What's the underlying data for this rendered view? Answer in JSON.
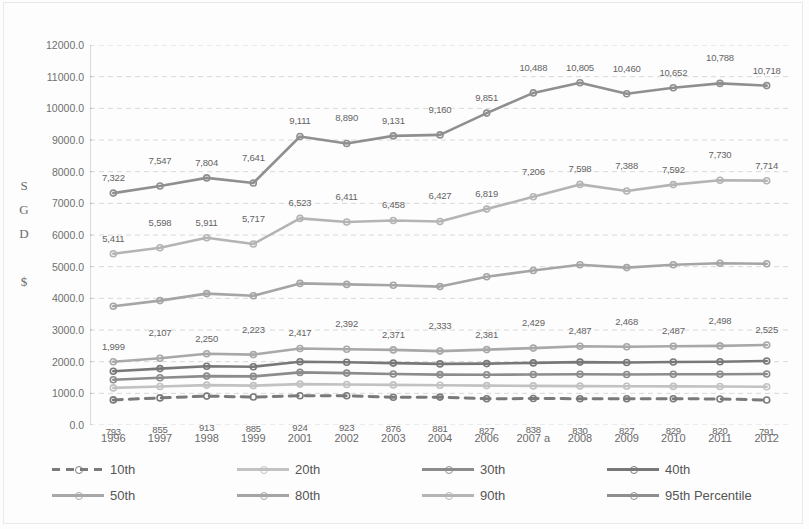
{
  "chart_data": {
    "type": "line",
    "title": "",
    "xlabel": "",
    "ylabel": "SGD $",
    "ylim": [
      0,
      12000
    ],
    "ytick_step": 1000,
    "grid": true,
    "legend_position": "bottom",
    "categories": [
      "1996",
      "1997",
      "1998",
      "1999",
      "2001",
      "2002",
      "2003",
      "2004",
      "2006",
      "2007 a",
      "2008",
      "2009",
      "2010",
      "2011",
      "2012"
    ],
    "ytick_labels": [
      "12000.0",
      "11000.0",
      "10000.0",
      "9000.0",
      "8000.0",
      "7000.0",
      "6000.0",
      "5000.0",
      "4000.0",
      "3000.0",
      "2000.0",
      "1000.0",
      "0.0"
    ],
    "series": [
      {
        "name": "10th",
        "color": "#7a7a7a",
        "style": "dashed",
        "labeled": true,
        "values": [
          793,
          855,
          913,
          885,
          924,
          923,
          876,
          881,
          827,
          838,
          830,
          827,
          829,
          820,
          791
        ],
        "labels": [
          "793",
          "855",
          "913",
          "885",
          "924",
          "923",
          "876",
          "881",
          "827",
          "838",
          "830",
          "827",
          "829",
          "820",
          "791"
        ],
        "label_position": "below"
      },
      {
        "name": "20th",
        "color": "#c2c2c2",
        "style": "solid",
        "labeled": false,
        "values": [
          1170,
          1215,
          1260,
          1245,
          1290,
          1280,
          1265,
          1255,
          1245,
          1235,
          1230,
          1225,
          1220,
          1215,
          1210
        ],
        "labels": [],
        "label_position": "none"
      },
      {
        "name": "30th",
        "color": "#8c8c8c",
        "style": "solid",
        "labeled": false,
        "values": [
          1430,
          1490,
          1545,
          1535,
          1660,
          1640,
          1610,
          1590,
          1585,
          1595,
          1600,
          1595,
          1600,
          1605,
          1610
        ],
        "labels": [],
        "label_position": "none"
      },
      {
        "name": "40th",
        "color": "#787878",
        "style": "solid",
        "labeled": false,
        "values": [
          1700,
          1780,
          1855,
          1840,
          1995,
          1980,
          1955,
          1930,
          1940,
          1960,
          1985,
          1975,
          1990,
          2000,
          2020
        ],
        "labels": [],
        "label_position": "none"
      },
      {
        "name": "50th",
        "color": "#a8a8a8",
        "style": "solid",
        "labeled": true,
        "values": [
          1999,
          2107,
          2250,
          2223,
          2417,
          2392,
          2371,
          2333,
          2381,
          2429,
          2487,
          2468,
          2487,
          2498,
          2525
        ],
        "labels": [
          "1,999",
          "2,107",
          "2,250",
          "2,223",
          "2,417",
          "2,392",
          "2,371",
          "2,333",
          "2,381",
          "2,429",
          "2,487",
          "2,468",
          "2,487",
          "2,498",
          "2,525"
        ],
        "label_position": "above"
      },
      {
        "name": "80th",
        "color": "#a5a5a5",
        "style": "solid",
        "labeled": false,
        "values": [
          3750,
          3930,
          4150,
          4080,
          4470,
          4440,
          4410,
          4370,
          4680,
          4880,
          5060,
          4970,
          5060,
          5105,
          5090
        ],
        "labels": [],
        "label_position": "none"
      },
      {
        "name": "90th",
        "color": "#b4b4b4",
        "style": "solid",
        "labeled": true,
        "values": [
          5411,
          5598,
          5911,
          5717,
          6523,
          6411,
          6458,
          6427,
          6819,
          7206,
          7598,
          7388,
          7592,
          7730,
          7714
        ],
        "labels": [
          "5,411",
          "5,598",
          "5,911",
          "5,717",
          "6,523",
          "6,411",
          "6,458",
          "6,427",
          "6,819",
          "7,206",
          "7,598",
          "7,388",
          "7,592",
          "7,730",
          "7,714"
        ],
        "label_position": "above"
      },
      {
        "name": "95th Percentile",
        "color": "#8f8f8f",
        "style": "solid",
        "labeled": true,
        "values": [
          7322,
          7547,
          7804,
          7641,
          9111,
          8890,
          9131,
          9160,
          9851,
          10488,
          10805,
          10460,
          10652,
          10788,
          10718
        ],
        "labels": [
          "7,322",
          "7,547",
          "7,804",
          "7,641",
          "9,111",
          "8,890",
          "9,131",
          "9,160",
          "9,851",
          "10,488",
          "10,805",
          "10,460",
          "10,652",
          "10,788",
          "10,718"
        ],
        "label_position": "above"
      }
    ]
  },
  "axis": {
    "vertical_label_lines": [
      "S",
      "G",
      "D",
      "",
      "$"
    ],
    "y_unit": "SGD $"
  },
  "legend": {
    "items": [
      {
        "label": "10th"
      },
      {
        "label": "20th"
      },
      {
        "label": "30th"
      },
      {
        "label": "40th"
      },
      {
        "label": "50th"
      },
      {
        "label": "80th"
      },
      {
        "label": "90th"
      },
      {
        "label": "95th Percentile"
      }
    ]
  },
  "colors": {
    "grid": "#d8d8d8",
    "axis": "#b8b8b8",
    "text": "#6a6a6a",
    "background": "#fdfdfd"
  }
}
